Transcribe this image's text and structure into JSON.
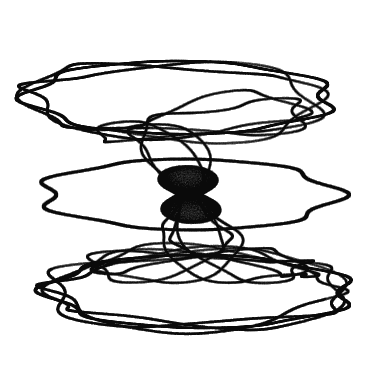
{
  "figure": {
    "kind": "attractor-plot",
    "title": "",
    "caption": "",
    "width": 371,
    "height": 387,
    "background_color": "#ffffff",
    "ink_color": "#000000",
    "darkest_value": "#0a0a0a",
    "lightest_fill": "#f6f6f6",
    "has_axes": false,
    "has_legend": false,
    "has_labels": false,
    "has_frame": false
  },
  "chart_data": {
    "type": "scatter",
    "title": "",
    "subtitle": "",
    "xlabel": "",
    "ylabel": "",
    "grid": false,
    "legend_position": "none",
    "xlim": [
      -1.35,
      1.35
    ],
    "ylim": [
      -1.4,
      1.4
    ],
    "point_color": "#000000",
    "point_alpha": 0.022,
    "point_size": 0.55,
    "n_points": 260000,
    "bounds_px": {
      "left": 22,
      "right": 356,
      "top": 20,
      "bottom": 368
    },
    "structure": {
      "disk_count": 3,
      "disk_centers_y": [
        -0.78,
        0.0,
        0.78
      ],
      "disk_radius_x": 1.22,
      "disk_radius_y": 0.3,
      "rim_thickness": 0.035,
      "waist_radius": 0.09,
      "waist_y": [
        -0.12,
        0.12
      ],
      "twist_turns": 2.5,
      "lobe_count": 7
    },
    "series": [
      {
        "name": "trace",
        "generator": "torus-twist-harmonic",
        "params": {
          "a": 1.22,
          "b": 0.3,
          "c": 0.78,
          "d": 2.5,
          "e": 7.0,
          "f": 0.09,
          "p": 3.0,
          "q": 11.0
        }
      }
    ]
  },
  "render": {
    "seed": 20240517,
    "mode": "additive-darken",
    "gamma": 0.92
  }
}
